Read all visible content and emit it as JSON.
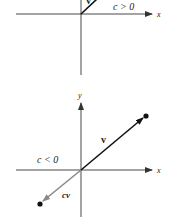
{
  "panels": [
    {
      "id": "top",
      "condition_label": "c > 0",
      "axis_x_label": "x",
      "vector_label": "v",
      "origin": [
        81,
        14
      ],
      "vector_end": [
        96,
        0
      ],
      "colors": {
        "axis": "#333333",
        "vector": "#111111"
      }
    },
    {
      "id": "bottom",
      "condition_label": "c < 0",
      "axis_x_label": "x",
      "axis_y_label": "y",
      "vector_label": "v",
      "scaled_vector_label": "cv",
      "origin": [
        81,
        170
      ],
      "vector_end": [
        146,
        116
      ],
      "scaled_vector_end": [
        40,
        204
      ],
      "colors": {
        "axis": "#333333",
        "vector": "#111111",
        "scaled_vector": "#8a8a8a"
      }
    }
  ]
}
